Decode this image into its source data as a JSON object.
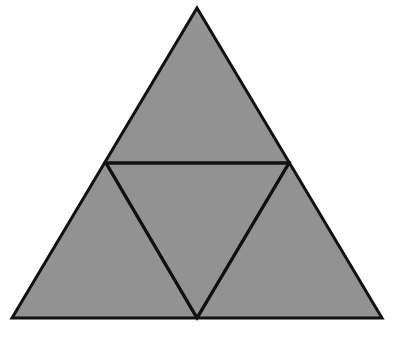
{
  "document": {
    "title": "Subdivided Equilateral Triangle",
    "background_color": "#ffffff",
    "width": 403,
    "height": 343
  },
  "figure": {
    "name": "medial-triangle-subdivision",
    "fill_color": "#929292",
    "stroke_color": "#111111",
    "stroke_width": 3,
    "outer_triangle": {
      "label": "outer-triangle",
      "points": "197,8 382,318 12,318",
      "vertices": [
        {
          "name": "apex",
          "x": 197,
          "y": 8
        },
        {
          "name": "bottom-right",
          "x": 382,
          "y": 318
        },
        {
          "name": "bottom-left",
          "x": 12,
          "y": 318
        }
      ]
    },
    "inner_triangle": {
      "label": "inverted-inner-triangle",
      "points": "106,163 289,163 197,318",
      "vertices": [
        {
          "name": "left-midpoint",
          "x": 106,
          "y": 163
        },
        {
          "name": "right-midpoint",
          "x": 289,
          "y": 163
        },
        {
          "name": "base-midpoint",
          "x": 197,
          "y": 318
        }
      ]
    },
    "segments": [
      {
        "name": "horizontal-midsegment",
        "x1": 106,
        "y1": 163,
        "x2": 289,
        "y2": 163
      },
      {
        "name": "left-slant-midsegment",
        "x1": 106,
        "y1": 163,
        "x2": 197,
        "y2": 318
      },
      {
        "name": "right-slant-midsegment",
        "x1": 289,
        "y1": 163,
        "x2": 197,
        "y2": 318
      }
    ]
  }
}
